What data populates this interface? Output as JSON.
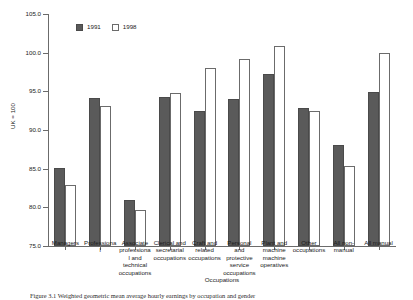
{
  "chart_data": {
    "type": "bar",
    "title": "",
    "xlabel": "Occupations",
    "ylabel": "UK = 100",
    "ylim": [
      75.0,
      105.0
    ],
    "ytick_step": 5.0,
    "ytick_labels": [
      "75.0",
      "80.0",
      "85.0",
      "90.0",
      "95.0",
      "100.0",
      "105.0"
    ],
    "grid": false,
    "legend_position": "top-left",
    "categories": [
      "Managers",
      "Professional",
      "Associate professional and technical occupations",
      "Clerical and secretarial occupations",
      "Craft and related occupations",
      "Personal and protective service occupations",
      "Plant and machine machine operatives",
      "Other occupations",
      "All non-manual",
      "All manual"
    ],
    "series": [
      {
        "name": "1991",
        "color": "#5a5a5a",
        "values": [
          85.1,
          94.2,
          80.9,
          94.3,
          92.5,
          94.0,
          97.3,
          92.8,
          88.0,
          94.9
        ]
      },
      {
        "name": "1998",
        "color": "#ffffff",
        "values": [
          82.9,
          93.1,
          79.6,
          94.8,
          98.0,
          99.2,
          100.8,
          92.5,
          85.4,
          100.0
        ]
      }
    ]
  },
  "legend": {
    "items": [
      {
        "label": "1991"
      },
      {
        "label": "1998"
      }
    ]
  },
  "caption": {
    "text": "Figure 3.1   Weighted geometric mean average hourly earnings by occupation and gender"
  }
}
